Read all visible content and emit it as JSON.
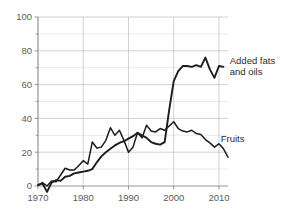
{
  "chart_data": {
    "type": "line",
    "title": "",
    "subtitle": "",
    "xlabel": "",
    "ylabel": "",
    "xlim": [
      1970,
      2012
    ],
    "ylim": [
      0,
      100
    ],
    "grid": true,
    "legend_position": "inline-right-annotations",
    "y_ticks_major": [
      0,
      20,
      40,
      60,
      80,
      100
    ],
    "y_ticks_minor": [
      10,
      30,
      50,
      70,
      90
    ],
    "x_ticks": [
      1970,
      1980,
      1990,
      2000,
      2010
    ],
    "y_tick_labels": [
      "0",
      "20",
      "40",
      "60",
      "80",
      "100"
    ],
    "x_tick_labels": [
      "1970",
      "1980",
      "1990",
      "2000",
      "2010"
    ],
    "annotations": [
      {
        "id": "fats",
        "text_line1": "Added fats",
        "text_line2": "and oils",
        "x": 2011.5,
        "y": 72
      },
      {
        "id": "fruits",
        "text_line1": "Fruits",
        "text_line2": "",
        "x": 2009.5,
        "y": 26
      }
    ],
    "series": [
      {
        "name": "Added fats and oils",
        "color": "#1c1c1c",
        "x": [
          1970,
          1971,
          1972,
          1973,
          1974,
          1975,
          1976,
          1977,
          1978,
          1979,
          1980,
          1981,
          1982,
          1983,
          1984,
          1985,
          1986,
          1987,
          1988,
          1989,
          1990,
          1991,
          1992,
          1993,
          1994,
          1995,
          1996,
          1997,
          1998,
          1999,
          2000,
          2001,
          2002,
          2003,
          2004,
          2005,
          2006,
          2007,
          2008,
          2009,
          2010,
          2011
        ],
        "values": [
          0.5,
          1.5,
          -3.5,
          2.0,
          3.5,
          3.0,
          5.5,
          6.0,
          7.5,
          8.0,
          8.5,
          9.0,
          10.0,
          14.0,
          17.5,
          20.0,
          22.0,
          24.0,
          25.5,
          26.5,
          28.0,
          29.5,
          31.5,
          30.0,
          28.5,
          26.0,
          25.0,
          24.5,
          26.0,
          45.0,
          62.0,
          68.0,
          71.0,
          71.0,
          70.5,
          71.5,
          70.5,
          76.0,
          69.0,
          64.0,
          71.0,
          70.5
        ]
      },
      {
        "name": "Fruits",
        "color": "#1c1c1c",
        "x": [
          1970,
          1971,
          1972,
          1973,
          1974,
          1975,
          1976,
          1977,
          1978,
          1979,
          1980,
          1981,
          1982,
          1983,
          1984,
          1985,
          1986,
          1987,
          1988,
          1989,
          1990,
          1991,
          1992,
          1993,
          1994,
          1995,
          1996,
          1997,
          1998,
          1999,
          2000,
          2001,
          2002,
          2003,
          2004,
          2005,
          2006,
          2007,
          2008,
          2009,
          2010,
          2011,
          2012
        ],
        "values": [
          0.5,
          2.0,
          0.0,
          3.0,
          2.5,
          6.5,
          10.5,
          9.5,
          9.5,
          12.0,
          15.0,
          13.0,
          26.0,
          22.5,
          23.0,
          27.0,
          34.5,
          30.0,
          33.0,
          27.0,
          20.0,
          23.0,
          31.5,
          28.5,
          36.0,
          32.5,
          32.0,
          34.0,
          33.0,
          35.5,
          38.0,
          34.0,
          32.5,
          32.0,
          33.0,
          31.0,
          30.5,
          27.5,
          25.5,
          23.0,
          25.0,
          22.0,
          17.0
        ]
      }
    ]
  },
  "plot_geometry": {
    "left": 38,
    "right": 228,
    "top": 17,
    "bottom": 186
  }
}
